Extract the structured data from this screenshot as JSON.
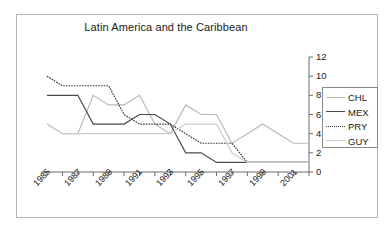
{
  "chart_data": {
    "type": "line",
    "title": "Latin America and the Caribbean",
    "xlabel": "",
    "ylabel": "",
    "ylim": [
      0,
      12
    ],
    "ytick_values": [
      0,
      2,
      4,
      6,
      8,
      10,
      12
    ],
    "ytick_labels": [
      "0",
      "2",
      "4",
      "6",
      "8",
      "10",
      "12"
    ],
    "y_axis_position": "right",
    "xlim": [
      1985,
      2002
    ],
    "x": [
      1985,
      1986,
      1987,
      1988,
      1989,
      1990,
      1991,
      1992,
      1993,
      1994,
      1995,
      1996,
      1997,
      1998,
      1999,
      2000,
      2001,
      2002
    ],
    "xtick_labels": [
      "1985",
      "1987",
      "1989",
      "1991",
      "1993",
      "1995",
      "1997",
      "1999",
      "2001"
    ],
    "xtick_values": [
      1985,
      1987,
      1989,
      1991,
      1993,
      1995,
      1997,
      1999,
      2001
    ],
    "xtick_label_rotation": -45,
    "grid": false,
    "legend_position": "right",
    "series": [
      {
        "name": "CHL",
        "color": "#b8b8b8",
        "style": "solid",
        "values": [
          5,
          4,
          4,
          8,
          7,
          7,
          8,
          5,
          4,
          7,
          6,
          6,
          3,
          4,
          5,
          4,
          3,
          3
        ]
      },
      {
        "name": "MEX",
        "color": "#4a4a4a",
        "style": "solid",
        "values": [
          8,
          8,
          8,
          5,
          5,
          5,
          6,
          6,
          5,
          2,
          2,
          1,
          1,
          1,
          1,
          1,
          1,
          1
        ]
      },
      {
        "name": "PRY",
        "color": "#3a3a3a",
        "style": "dotted",
        "values": [
          10,
          9,
          9,
          9,
          9,
          6,
          5,
          5,
          5,
          4,
          3,
          3,
          3,
          1,
          1,
          1,
          1,
          1
        ]
      },
      {
        "name": "GUY",
        "color": "#cccccc",
        "style": "solid",
        "values": [
          5,
          4,
          4,
          4,
          4,
          4,
          4,
          4,
          4,
          5,
          5,
          5,
          2,
          1,
          1,
          1,
          1,
          1
        ]
      }
    ]
  },
  "legend": {
    "entries": [
      {
        "label": "CHL"
      },
      {
        "label": "MEX"
      },
      {
        "label": "PRY"
      },
      {
        "label": "GUY"
      }
    ]
  },
  "colors": {
    "axis": "#6b6b6b",
    "frame": "#b6b6b6",
    "text": "#1a1a1a",
    "background": "#ffffff"
  }
}
